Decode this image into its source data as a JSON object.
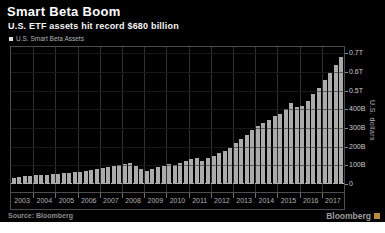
{
  "header": {
    "title": "Smart Beta Boom",
    "subtitle": "U.S. ETF assets hit record $680 billion"
  },
  "legend": {
    "label": "U.S. Smart Beta Assets",
    "marker_color": "#e0e0e0"
  },
  "chart_data": {
    "type": "bar",
    "title": "Smart Beta Boom",
    "subtitle": "U.S. ETF assets hit record $680 billion",
    "series_name": "U.S. Smart Beta Assets",
    "unit": "USD billions",
    "frequency": "quarterly",
    "categories_years": [
      "2003",
      "2004",
      "2005",
      "2006",
      "2007",
      "2008",
      "2009",
      "2010",
      "2011",
      "2012",
      "2013",
      "2014",
      "2015",
      "2016",
      "2017"
    ],
    "values": [
      35,
      38,
      41,
      44,
      46,
      49,
      51,
      53,
      55,
      57,
      59,
      62,
      65,
      69,
      73,
      78,
      85,
      92,
      98,
      104,
      109,
      112,
      98,
      82,
      72,
      79,
      89,
      99,
      105,
      101,
      113,
      126,
      133,
      140,
      122,
      138,
      152,
      165,
      178,
      195,
      218,
      240,
      262,
      292,
      310,
      326,
      344,
      363,
      377,
      400,
      435,
      412,
      420,
      445,
      480,
      515,
      555,
      595,
      640,
      680
    ],
    "ylabel": "U.S. dollars",
    "y_axis": [
      {
        "value": 700,
        "label": "0.7T"
      },
      {
        "value": 600,
        "label": "0.6T"
      },
      {
        "value": 500,
        "label": "0.5T"
      },
      {
        "value": 400,
        "label": "400B"
      },
      {
        "value": 300,
        "label": "300B"
      },
      {
        "value": 200,
        "label": "200B"
      },
      {
        "value": 100,
        "label": "100B"
      },
      {
        "value": 0,
        "label": "0"
      }
    ],
    "ylim": [
      0,
      742
    ],
    "grid": true,
    "bar_color": "#ababab",
    "background_color": "#000000",
    "legend_position": "top-left",
    "y_axis_position": "right"
  },
  "footer": {
    "source": "Source: Bloomberg",
    "brand": "Bloomberg",
    "brand_logo_color": "#bd8a3f"
  }
}
